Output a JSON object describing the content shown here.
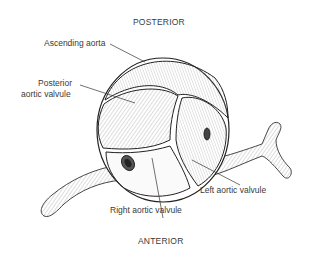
{
  "orientation": {
    "top": "POSTERIOR",
    "bottom": "ANTERIOR"
  },
  "labels": {
    "ascending_aorta": "Ascending aorta",
    "posterior_line1": "Posterior",
    "posterior_line2": "aortic valvule",
    "left_valvule": "Left aortic valvule",
    "right_valvule": "Right aortic valvule"
  }
}
